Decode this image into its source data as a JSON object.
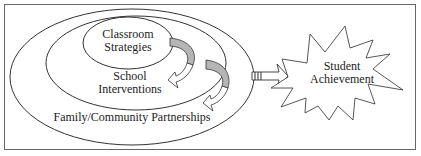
{
  "diagram": {
    "outer_ellipse_label": "Family/Community Partnerships",
    "middle_ellipse_label_line1": "School",
    "middle_ellipse_label_line2": "Interventions",
    "inner_ellipse_label_line1": "Classroom",
    "inner_ellipse_label_line2": "Strategies",
    "outcome_label_line1": "Student",
    "outcome_label_line2": "Achievement",
    "colors": {
      "line": "#333333",
      "arrow_fill": "#b5b5b5",
      "background": "#ffffff"
    }
  }
}
